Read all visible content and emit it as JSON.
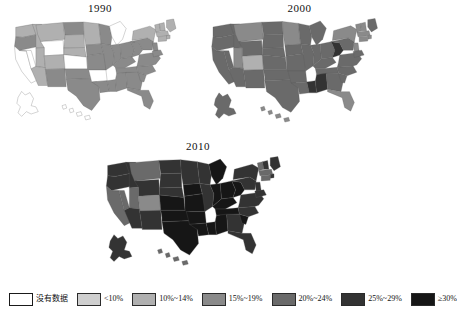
{
  "chart_data": {
    "type": "choropleth-series",
    "title": "",
    "subtitle": "",
    "xlabel": "",
    "ylabel": "",
    "legend_position": "bottom",
    "grid": false,
    "panels": [
      {
        "label": "1990"
      },
      {
        "label": "2000"
      },
      {
        "label": "2010"
      }
    ],
    "legend": {
      "entries": [
        {
          "label": "没有数据",
          "color": "#ffffff",
          "key": "nodata"
        },
        {
          "label": "<10%",
          "color": "#cfcfcf",
          "key": "lt10"
        },
        {
          "label": "10%~14%",
          "color": "#b0b0b0",
          "key": "b10_14"
        },
        {
          "label": "15%~19%",
          "color": "#8a8a8a",
          "key": "b15_19"
        },
        {
          "label": "20%~24%",
          "color": "#6a6a6a",
          "key": "b20_24"
        },
        {
          "label": "25%~29%",
          "color": "#333333",
          "key": "b25_29"
        },
        {
          "label": "≥30%",
          "color": "#161616",
          "key": "ge30"
        }
      ]
    },
    "categories": [
      "没有数据",
      "<10%",
      "10%~14%",
      "15%~19%",
      "20%~24%",
      "25%~29%",
      "≥30%"
    ],
    "series": [
      {
        "name": "1990",
        "values": {
          "WA": "b10_14",
          "OR": "b15_19",
          "CA": "nodata",
          "NV": "nodata",
          "ID": "b10_14",
          "MT": "b10_14",
          "WY": "nodata",
          "UT": "b10_14",
          "AZ": "b10_14",
          "CO": "b10_14",
          "NM": "b15_19",
          "ND": "b15_19",
          "SD": "b10_14",
          "NE": "b10_14",
          "KS": "nodata",
          "OK": "b15_19",
          "TX": "b15_19",
          "MN": "b10_14",
          "IA": "b15_19",
          "MO": "b15_19",
          "AR": "nodata",
          "LA": "b15_19",
          "WI": "b15_19",
          "IL": "b15_19",
          "MS": "b15_19",
          "MI": "nodata",
          "IN": "b15_19",
          "KY": "b15_19",
          "TN": "b15_19",
          "AL": "b15_19",
          "OH": "b15_19",
          "WV": "b15_19",
          "GA": "b15_19",
          "FL": "b15_19",
          "SC": "b15_19",
          "NC": "b15_19",
          "VA": "b15_19",
          "PA": "b15_19",
          "NY": "b10_14",
          "ME": "b10_14",
          "VT": "b10_14",
          "NH": "b10_14",
          "MA": "b10_14",
          "RI": "b10_14",
          "CT": "b10_14",
          "NJ": "b15_19",
          "DE": "b15_19",
          "MD": "b15_19",
          "AK": "nodata",
          "HI": "nodata"
        }
      },
      {
        "name": "2000",
        "values": {
          "WA": "b20_24",
          "OR": "b20_24",
          "CA": "b20_24",
          "NV": "b20_24",
          "ID": "b20_24",
          "MT": "b15_19",
          "WY": "b20_24",
          "UT": "b15_19",
          "AZ": "b20_24",
          "CO": "b10_14",
          "NM": "b20_24",
          "ND": "b20_24",
          "SD": "b20_24",
          "NE": "b20_24",
          "KS": "b20_24",
          "OK": "b20_24",
          "TX": "b20_24",
          "MN": "b15_19",
          "IA": "b20_24",
          "MO": "b20_24",
          "AR": "b20_24",
          "LA": "b20_24",
          "WI": "b20_24",
          "IL": "b20_24",
          "MS": "b25_29",
          "MI": "b20_24",
          "IN": "b20_24",
          "KY": "b20_24",
          "TN": "b20_24",
          "AL": "b25_29",
          "OH": "b20_24",
          "WV": "b25_29",
          "GA": "b20_24",
          "FL": "b15_19",
          "SC": "b20_24",
          "NC": "b20_24",
          "VA": "b20_24",
          "PA": "b20_24",
          "NY": "b15_19",
          "ME": "b20_24",
          "VT": "b15_19",
          "NH": "b15_19",
          "MA": "b15_19",
          "RI": "b15_19",
          "CT": "b15_19",
          "NJ": "b15_19",
          "DE": "b20_24",
          "MD": "b20_24",
          "AK": "b20_24",
          "HI": "b15_19"
        }
      },
      {
        "name": "2010",
        "values": {
          "WA": "b25_29",
          "OR": "b25_29",
          "CA": "b20_24",
          "NV": "b20_24",
          "ID": "b25_29",
          "MT": "b20_24",
          "WY": "b25_29",
          "UT": "b20_24",
          "AZ": "b25_29",
          "CO": "b15_19",
          "NM": "b25_29",
          "ND": "b25_29",
          "SD": "b25_29",
          "NE": "b25_29",
          "KS": "ge30",
          "OK": "ge30",
          "TX": "ge30",
          "MN": "b25_29",
          "IA": "ge30",
          "MO": "ge30",
          "AR": "ge30",
          "LA": "ge30",
          "WI": "b25_29",
          "IL": "b25_29",
          "MS": "ge30",
          "MI": "ge30",
          "IN": "ge30",
          "KY": "ge30",
          "TN": "ge30",
          "AL": "ge30",
          "OH": "ge30",
          "WV": "ge30",
          "GA": "b25_29",
          "FL": "b25_29",
          "SC": "ge30",
          "NC": "b25_29",
          "VA": "b25_29",
          "PA": "b25_29",
          "NY": "b25_29",
          "ME": "b25_29",
          "VT": "b20_24",
          "NH": "b25_29",
          "MA": "b20_24",
          "RI": "b25_29",
          "CT": "b20_24",
          "NJ": "b25_29",
          "DE": "b25_29",
          "MD": "b25_29",
          "AK": "b25_29",
          "HI": "b20_24"
        }
      }
    ]
  }
}
